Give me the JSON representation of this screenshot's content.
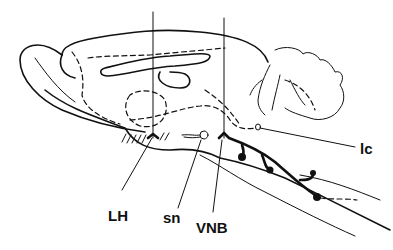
{
  "diagram": {
    "type": "sagittal brain section line drawing",
    "labels": {
      "lh": "LH",
      "sn": "sn",
      "vnb": "VNB",
      "lc": "lc"
    },
    "colors": {
      "line": "#111111",
      "background": "#ffffff"
    }
  }
}
